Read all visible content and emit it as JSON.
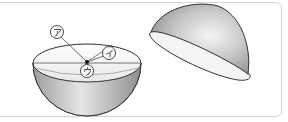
{
  "figure": {
    "labels": [
      {
        "id": "a",
        "text": "ア"
      },
      {
        "id": "i",
        "text": "イ"
      },
      {
        "id": "u",
        "text": "ウ"
      }
    ],
    "colors": {
      "frame": "#d4d4d4",
      "outline": "#333333",
      "shade_dark": "#9a9a9a",
      "shade_light": "#f2f2f2"
    }
  }
}
